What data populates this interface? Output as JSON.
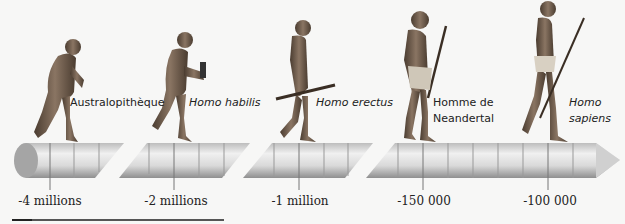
{
  "figure": {
    "species": [
      {
        "name": "Australopithèque",
        "italic": false,
        "date": "-4 millions"
      },
      {
        "name": "Homo habilis",
        "italic": true,
        "date": "-2 millions"
      },
      {
        "name": "Homo erectus",
        "italic": true,
        "date": "-1 million"
      },
      {
        "name": "Homme de Neandertal",
        "line1": "Homme de",
        "line2": "Neandertal",
        "italic": false,
        "date": "-150 000"
      },
      {
        "name": "Homo sapiens",
        "line1": "Homo",
        "line2": "sapiens",
        "italic": true,
        "date": "-100 000"
      }
    ],
    "colors": {
      "background": "#f7f7f6",
      "timeline_light": "#e8e8e8",
      "timeline_dark": "#9a9a9a",
      "figure_skin": "#6b5a4a"
    }
  }
}
